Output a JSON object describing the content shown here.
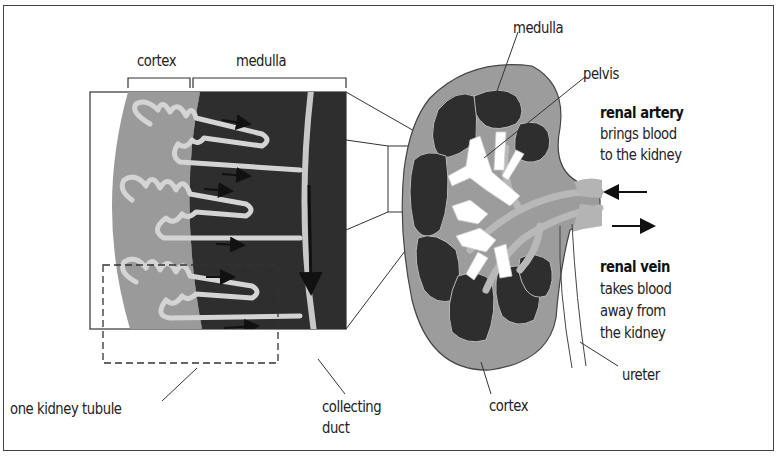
{
  "diagram": {
    "colors": {
      "cortex": "#9a9a9a",
      "medulla": "#2e2e2e",
      "tubule": "#c8c8c8",
      "pelvis": "#ffffff",
      "vessels": "#b4b4b4",
      "lines": "#222222"
    },
    "magnified_section": {
      "cortex_label": "cortex",
      "medulla_label": "medulla",
      "tubule_label": "one kidney tubule",
      "duct_label_line1": "collecting",
      "duct_label_line2": "duct"
    },
    "kidney": {
      "medulla_label": "medulla",
      "pelvis_label": "pelvis",
      "cortex_label": "cortex",
      "ureter_label": "ureter",
      "renal_artery": {
        "title": "renal artery",
        "line1": "brings blood",
        "line2": "to the kidney"
      },
      "renal_vein": {
        "title": "renal vein",
        "line1": "takes blood",
        "line2": "away from",
        "line3": "the kidney"
      }
    }
  }
}
